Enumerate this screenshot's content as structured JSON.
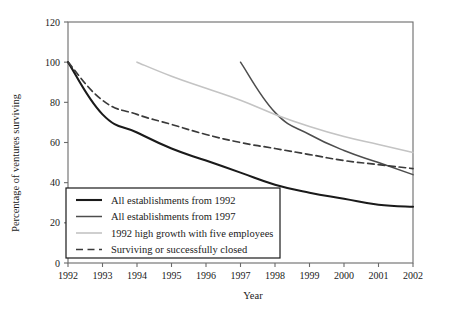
{
  "chart_data": {
    "type": "line",
    "title": "",
    "xlabel": "Year",
    "ylabel": "Percentage of ventures surviving",
    "x": [
      1992,
      1993,
      1994,
      1995,
      1996,
      1997,
      1998,
      1999,
      2000,
      2001,
      2002
    ],
    "xlim": [
      1992,
      2002
    ],
    "ylim": [
      0,
      120
    ],
    "yticks": [
      0,
      20,
      40,
      60,
      80,
      100,
      120
    ],
    "xticks": [
      "1992",
      "1993",
      "1994",
      "1995",
      "1996",
      "1997",
      "1998",
      "1999",
      "2000",
      "2001",
      "2002"
    ],
    "ytick_labels": [
      "0",
      "20",
      "40",
      "60",
      "80",
      "100",
      "120"
    ],
    "grid": false,
    "legend_position": "lower-left-inside",
    "series": [
      {
        "name": "All establishments from 1992",
        "color": "#1a1a1a",
        "style": "solid",
        "width": 2.1,
        "x": [
          1992,
          1993,
          1994,
          1995,
          1996,
          1997,
          1998,
          1999,
          2000,
          2001,
          2002
        ],
        "values": [
          100,
          74,
          65,
          57,
          51,
          45,
          39,
          35,
          32,
          29,
          28
        ]
      },
      {
        "name": "All establishments from 1997",
        "color": "#4d4d4d",
        "style": "solid",
        "width": 1.5,
        "x": [
          1997,
          1998,
          1999,
          2000,
          2001,
          2002
        ],
        "values": [
          100,
          75,
          64,
          56,
          50,
          44
        ]
      },
      {
        "name": "1992 high growth with five employees",
        "color": "#c4c4c4",
        "style": "solid",
        "width": 1.6,
        "x": [
          1994,
          1995,
          1996,
          1997,
          1998,
          1999,
          2000,
          2001,
          2002
        ],
        "values": [
          100,
          93,
          87,
          81,
          74,
          68,
          63,
          59,
          55
        ]
      },
      {
        "name": "Surviving or successfully closed",
        "color": "#3a3a3a",
        "style": "dashed",
        "width": 1.7,
        "x": [
          1992,
          1993,
          1994,
          1995,
          1996,
          1997,
          1998,
          1999,
          2000,
          2001,
          2002
        ],
        "values": [
          100,
          81,
          74,
          69,
          64,
          60,
          57,
          54,
          51,
          49,
          47
        ]
      }
    ],
    "legend_entries": [
      {
        "label": "All establishments from 1992",
        "color": "#1a1a1a",
        "style": "solid",
        "width": 2.1
      },
      {
        "label": "All establishments from 1997",
        "color": "#4d4d4d",
        "style": "solid",
        "width": 1.5
      },
      {
        "label": "1992 high growth with five employees",
        "color": "#c4c4c4",
        "style": "solid",
        "width": 1.6
      },
      {
        "label": "Surviving or successfully closed",
        "color": "#3a3a3a",
        "style": "dashed",
        "width": 1.7
      }
    ]
  },
  "axis_colors": {
    "frame": "#6b6b6b",
    "tick": "#6b6b6b",
    "legend_border": "#1a1a1a"
  }
}
